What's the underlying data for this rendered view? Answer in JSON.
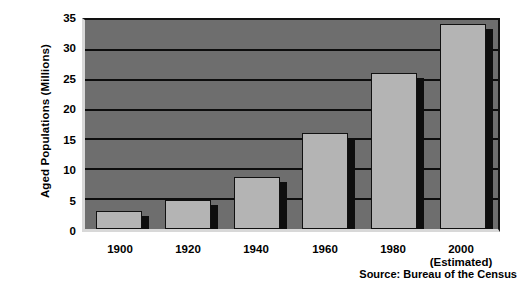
{
  "chart_data": {
    "type": "bar",
    "title": "",
    "xlabel": "",
    "ylabel": "Aged Populations (Millions)",
    "categories": [
      "1900",
      "1920",
      "1940",
      "1960",
      "1980",
      "2000"
    ],
    "category_sublabels": [
      "",
      "",
      "",
      "",
      "",
      "(Estimated)"
    ],
    "values": [
      3.0,
      4.9,
      8.7,
      16.0,
      26.1,
      34.3
    ],
    "series": [
      {
        "name": "Aged Population",
        "values": [
          3.0,
          4.9,
          8.7,
          16.0,
          26.1,
          34.3
        ]
      }
    ],
    "ylim": [
      0,
      35
    ],
    "yticks": [
      0,
      5,
      10,
      15,
      20,
      25,
      30,
      35
    ],
    "ytick_labels": [
      "0",
      "5",
      "10",
      "15",
      "20",
      "25",
      "30",
      "35"
    ],
    "grid": true,
    "grid_axis": "y",
    "legend": null,
    "annotation": "Source: Bureau of the Census",
    "colors": {
      "bar_fill": "#b4b4b4",
      "bar_edge": "#111111",
      "bar_shadow": "#0e0e0e",
      "plot_background": "#6e6e6e",
      "gridline": "#0d0d0d",
      "text": "#000000",
      "figure_background": "#ffffff"
    }
  }
}
